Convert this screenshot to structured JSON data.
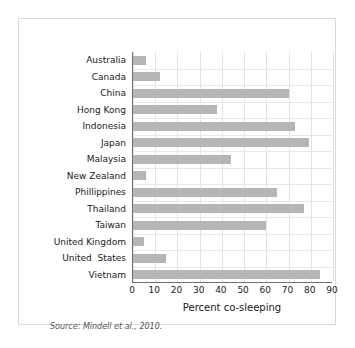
{
  "figure": {
    "source_note": "Source: Mindell et al., 2010.",
    "frame_color": "#d9d9d9",
    "axis_color": "#6f6f6f",
    "grid_color": "#e2e2e2",
    "background": "#ffffff"
  },
  "chart_data": {
    "type": "bar",
    "orientation": "horizontal",
    "title": "",
    "xlabel": "Percent co-sleeping",
    "ylabel": "",
    "xlim": [
      0,
      90
    ],
    "xticks": [
      0,
      10,
      20,
      30,
      40,
      50,
      60,
      70,
      80,
      90
    ],
    "grid": true,
    "legend": null,
    "bar_color": "#b6b6b6",
    "categories": [
      "Australia",
      "Canada",
      "China",
      "Hong Kong",
      "Indonesia",
      "Japan",
      "Malaysia",
      "New Zealand",
      "Phillippines",
      "Thailand",
      "Taiwan",
      "United Kingdom",
      "United  States",
      "Vietnam"
    ],
    "values": [
      6,
      12,
      70,
      38,
      73,
      79,
      44,
      6,
      65,
      77,
      60,
      5,
      15,
      84
    ]
  }
}
